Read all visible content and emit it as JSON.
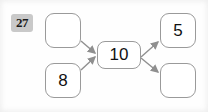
{
  "page": {
    "label_badge": "27",
    "background_color": "#fefefe"
  },
  "diagram": {
    "type": "function-machine",
    "node_border_color": "#9a9a9a",
    "edge_color": "#8f8f8f",
    "nodes": [
      {
        "id": "in-top",
        "value": "",
        "role": "input",
        "position": "top-left"
      },
      {
        "id": "in-bot",
        "value": "8",
        "role": "input",
        "position": "bottom-left"
      },
      {
        "id": "center",
        "value": "10",
        "role": "center",
        "position": "middle"
      },
      {
        "id": "out-top",
        "value": "5",
        "role": "output",
        "position": "top-right"
      },
      {
        "id": "out-bot",
        "value": "",
        "role": "output",
        "position": "bottom-right"
      }
    ],
    "edges": [
      {
        "from": "in-top",
        "to": "center",
        "direction": "down-right"
      },
      {
        "from": "in-bot",
        "to": "center",
        "direction": "up-right"
      },
      {
        "from": "center",
        "to": "out-top",
        "direction": "up-right"
      },
      {
        "from": "center",
        "to": "out-bot",
        "direction": "down-right"
      }
    ]
  }
}
